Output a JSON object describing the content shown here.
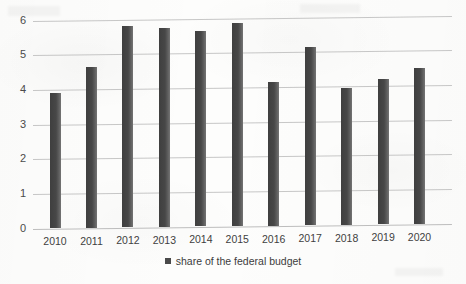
{
  "chart_data": {
    "type": "bar",
    "title": "",
    "xlabel": "",
    "ylabel": "",
    "categories": [
      "2010",
      "2011",
      "2012",
      "2013",
      "2014",
      "2015",
      "2016",
      "2017",
      "2018",
      "2019",
      "2020"
    ],
    "values": [
      3.9,
      4.65,
      5.8,
      5.75,
      5.65,
      5.85,
      4.15,
      5.15,
      3.95,
      4.2,
      4.5
    ],
    "series": [
      {
        "name": "share of the federal budget",
        "values": [
          3.9,
          4.65,
          5.8,
          5.75,
          5.65,
          5.85,
          4.15,
          5.15,
          3.95,
          4.2,
          4.5
        ]
      }
    ],
    "ylim": [
      0,
      6
    ],
    "ytick_labels": [
      "6",
      "5",
      "4",
      "3",
      "2",
      "1",
      "0"
    ],
    "ytick_values": [
      6,
      5,
      4,
      3,
      2,
      1,
      0
    ],
    "grid": true,
    "legend_position": "bottom",
    "bar_color": "#4a4a4a",
    "gridline_color": "#b9b9b9",
    "background_color": "#fdfdfc"
  },
  "legend": {
    "entries": [
      {
        "label": "share of the federal budget",
        "marker": "square-marker",
        "color": "#4a4a4a"
      }
    ]
  }
}
